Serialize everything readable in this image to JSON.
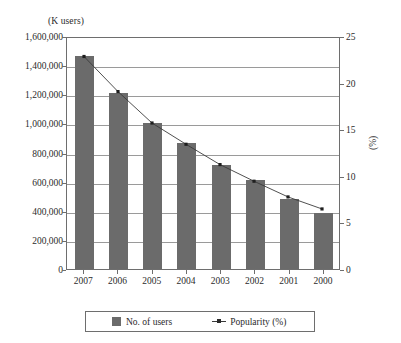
{
  "chart_data": {
    "type": "bar",
    "title": "",
    "subtitle": "",
    "categories": [
      "2007",
      "2006",
      "2005",
      "2004",
      "2003",
      "2002",
      "2001",
      "2000"
    ],
    "xlabel": "",
    "ylabel": "(K users)",
    "y2label": "(%)",
    "ylim": [
      0,
      1600000
    ],
    "y2lim": [
      0,
      25
    ],
    "yticks": [
      "0",
      "200,000",
      "400,000",
      "600,000",
      "800,000",
      "1,000,000",
      "1,200,000",
      "1,400,000",
      "1,600,000"
    ],
    "ytick_values": [
      0,
      200000,
      400000,
      600000,
      800000,
      1000000,
      1200000,
      1400000,
      1600000
    ],
    "y2ticks": [
      "0",
      "5",
      "10",
      "15",
      "20",
      "25"
    ],
    "y2tick_values": [
      0,
      5,
      10,
      15,
      20,
      25
    ],
    "grid": true,
    "legend_position": "bottom",
    "series": [
      {
        "name": "No. of users",
        "type": "bar",
        "axis": "left",
        "color": "#6b6b6b",
        "values": [
          1465000,
          1210000,
          1000000,
          865000,
          715000,
          610000,
          480000,
          385000
        ]
      },
      {
        "name": "Popularity (%)",
        "type": "line",
        "axis": "right",
        "color": "#3a3a3a",
        "marker": "dot",
        "values": [
          23.0,
          19.2,
          15.8,
          13.5,
          11.3,
          9.5,
          7.8,
          6.5
        ]
      }
    ]
  },
  "legend": {
    "items": [
      {
        "label": "No. of users",
        "marker": "square-swatch"
      },
      {
        "label": "Popularity (%)",
        "marker": "line-dot-swatch"
      }
    ]
  },
  "axes": {
    "left_title": "(K users)",
    "right_title": "(%)"
  }
}
